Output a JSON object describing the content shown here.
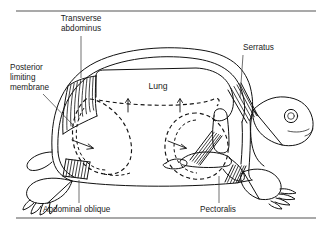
{
  "figure": {
    "domain": "diagram",
    "background_color": "#ffffff",
    "ink_color": "#111111",
    "labels": {
      "transverse_abdominus_line1": "Transverse",
      "transverse_abdominus_line2": "abdominus",
      "posterior_limiting_line1": "Posterior",
      "posterior_limiting_line2": "limiting",
      "posterior_limiting_line3": "membrane",
      "serratus": "Serratus",
      "lung": "Lung",
      "abdominal_oblique": "Abdominal oblique",
      "pectoralis": "Pectoralis"
    },
    "rules": {
      "top_rule_y": 11,
      "bottom_rule_y": 218
    },
    "annotations": {
      "arrow_up_left": "inspiratory-arrow-left",
      "arrow_up_right": "inspiratory-arrow-right",
      "arrow_posterior": "posterior-inward-arrow",
      "arrow_pectoral": "pectoral-inward-arrow"
    }
  }
}
